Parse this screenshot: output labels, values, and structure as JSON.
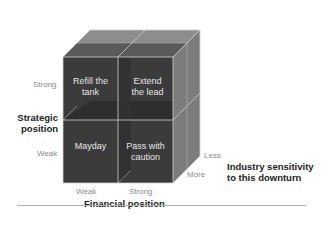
{
  "diagram": {
    "type": "2x2x2 strategy cube",
    "quadrants": [
      {
        "position": "top-left",
        "lines": [
          "Refill the",
          "tank"
        ]
      },
      {
        "position": "top-right",
        "lines": [
          "Extend",
          "the lead"
        ]
      },
      {
        "position": "bottom-left",
        "lines": [
          "Mayday"
        ]
      },
      {
        "position": "bottom-right",
        "lines": [
          "Pass with",
          "caution"
        ]
      }
    ],
    "y_axis": {
      "title_lines": [
        "Strategic",
        "position"
      ],
      "ticks": [
        "Strong",
        "Weak"
      ]
    },
    "x_axis": {
      "title": "Financial position",
      "ticks": [
        "Weak",
        "Strong"
      ]
    },
    "z_axis": {
      "title_lines": [
        "Industry sensitivity",
        "to this downturn"
      ],
      "ticks": [
        "Less",
        "More"
      ]
    },
    "colors": {
      "front": "#3a3a3a",
      "top": "#8c8c8c",
      "side": "#7a7a7a",
      "edge": "#c8c8c8",
      "cell_text": "#e6e6e6"
    }
  }
}
